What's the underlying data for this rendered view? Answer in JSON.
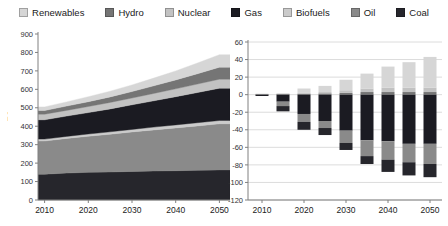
{
  "legend": {
    "items": [
      {
        "label": "Renewables",
        "color": "#d6d6d6"
      },
      {
        "label": "Hydro",
        "color": "#757575"
      },
      {
        "label": "Nuclear",
        "color": "#c2c2c2"
      },
      {
        "label": "Gas",
        "color": "#1b1b22"
      },
      {
        "label": "Biofuels",
        "color": "#cbcbcb"
      },
      {
        "label": "Oil",
        "color": "#8a8a8a"
      },
      {
        "label": "Coal",
        "color": "#26262c"
      }
    ]
  },
  "chart_data": [
    {
      "type": "area",
      "ylabel": "EJ",
      "x": [
        2010,
        2015,
        2020,
        2025,
        2030,
        2035,
        2040,
        2045,
        2050
      ],
      "xticks": [
        2010,
        2020,
        2030,
        2040,
        2050
      ],
      "ylim": [
        0,
        900
      ],
      "yticks": [
        0,
        100,
        200,
        300,
        400,
        500,
        600,
        700,
        800,
        900
      ],
      "grid": false,
      "stack_order": [
        "Coal",
        "Oil",
        "Biofuels",
        "Gas",
        "Nuclear",
        "Hydro",
        "Renewables"
      ],
      "series": [
        {
          "name": "Coal",
          "values": [
            140,
            146,
            150,
            152,
            155,
            157,
            159,
            161,
            163
          ]
        },
        {
          "name": "Oil",
          "values": [
            180,
            188,
            196,
            205,
            214,
            223,
            232,
            241,
            250
          ]
        },
        {
          "name": "Biofuels",
          "values": [
            10,
            11,
            12,
            13,
            14,
            15,
            16,
            17,
            18
          ]
        },
        {
          "name": "Gas",
          "values": [
            105,
            110,
            116,
            124,
            133,
            143,
            153,
            164,
            175
          ]
        },
        {
          "name": "Nuclear",
          "values": [
            30,
            31,
            33,
            35,
            37,
            40,
            43,
            46,
            49
          ]
        },
        {
          "name": "Hydro",
          "values": [
            20,
            23,
            26,
            30,
            35,
            41,
            48,
            56,
            65
          ]
        },
        {
          "name": "Renewables",
          "values": [
            20,
            23,
            27,
            31,
            36,
            42,
            49,
            58,
            68
          ]
        }
      ]
    },
    {
      "type": "bar",
      "x": [
        2010,
        2015,
        2020,
        2025,
        2030,
        2035,
        2040,
        2045,
        2050
      ],
      "xticks": [
        2010,
        2020,
        2030,
        2040,
        2050
      ],
      "ylim": [
        -120,
        60
      ],
      "yticks": [
        60,
        40,
        20,
        0,
        -20,
        -40,
        -60,
        -80,
        -100,
        -120
      ],
      "grid": true,
      "positive_order": [
        "Hydro",
        "Nuclear",
        "Renewables"
      ],
      "negative_order": [
        "Gas",
        "Oil",
        "Coal"
      ],
      "series": [
        {
          "name": "Renewables",
          "values": [
            0,
            0.5,
            5,
            7,
            12,
            17,
            24,
            29,
            35
          ]
        },
        {
          "name": "Hydro",
          "values": [
            0.5,
            0.5,
            1,
            1.5,
            2,
            3,
            3,
            3,
            3
          ]
        },
        {
          "name": "Nuclear",
          "values": [
            0.5,
            0.5,
            1,
            1.5,
            3,
            4,
            5,
            5,
            5
          ]
        },
        {
          "name": "Gas",
          "values": [
            -1.5,
            -8,
            -22,
            -30,
            -41,
            -52,
            -53,
            -56,
            -56
          ]
        },
        {
          "name": "Oil",
          "values": [
            0,
            -5,
            -9,
            -8,
            -14,
            -18,
            -21,
            -21,
            -23
          ]
        },
        {
          "name": "Coal",
          "values": [
            0,
            -6,
            -9,
            -8,
            -8,
            -9,
            -14,
            -15,
            -15
          ]
        }
      ]
    }
  ]
}
